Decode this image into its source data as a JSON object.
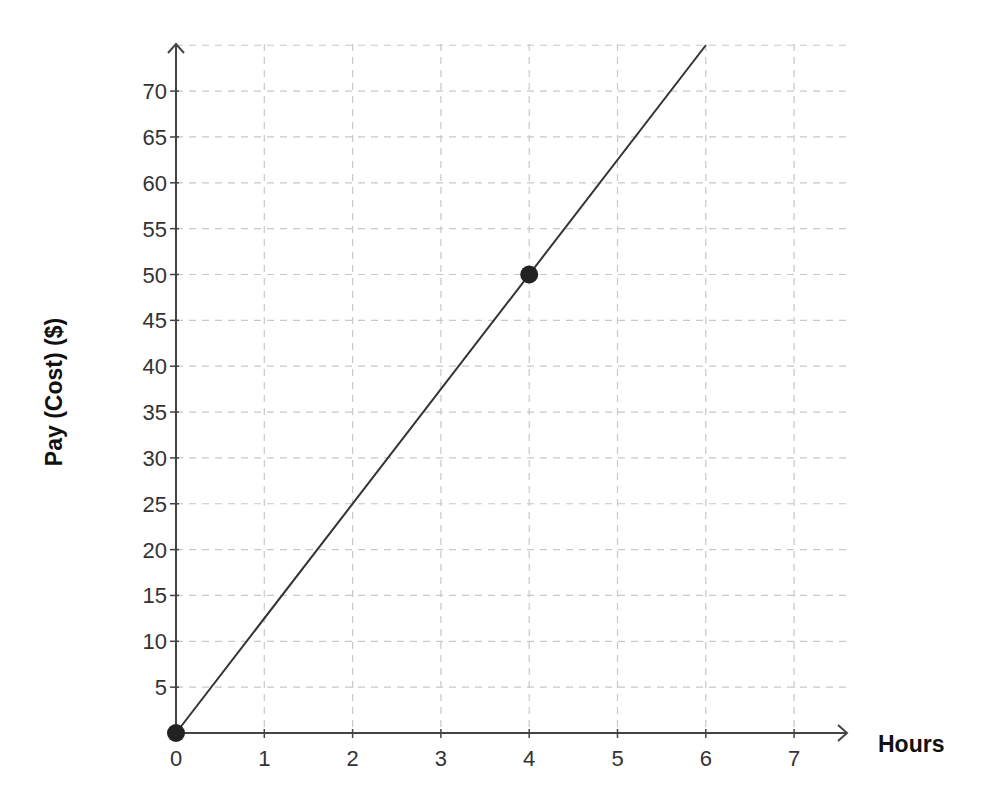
{
  "chart_data": {
    "type": "line",
    "title": "",
    "xlabel": "Hours",
    "ylabel": "Pay (Cost) ($)",
    "xlim": [
      0,
      7.5
    ],
    "ylim": [
      0,
      75
    ],
    "x_ticks": [
      0,
      1,
      2,
      3,
      4,
      5,
      6,
      7
    ],
    "y_ticks": [
      5,
      10,
      15,
      20,
      25,
      30,
      35,
      40,
      45,
      50,
      55,
      60,
      65,
      70
    ],
    "grid": true,
    "grid_style": "dashed",
    "series": [
      {
        "name": "Pay",
        "x": [
          0,
          6
        ],
        "y": [
          0,
          75
        ],
        "slope": 12.5,
        "color": "#333333"
      }
    ],
    "points": [
      {
        "x": 0,
        "y": 0
      },
      {
        "x": 4,
        "y": 50
      }
    ],
    "legend": null
  },
  "colors": {
    "axis": "#444444",
    "grid": "#c8c8c8",
    "line": "#333333",
    "point": "#222222",
    "text": "#333333"
  }
}
